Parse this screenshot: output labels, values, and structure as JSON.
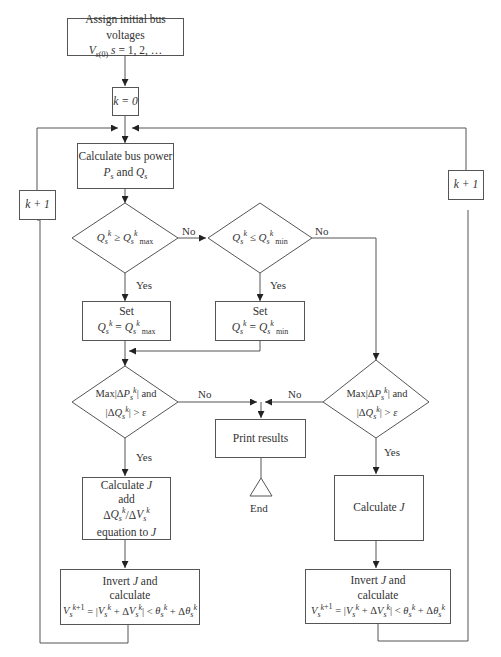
{
  "nodes": {
    "start": {
      "line1": "Assign initial bus voltages",
      "line2": "V s(0) s = 1, 2, …"
    },
    "k0": {
      "label": "k = 0"
    },
    "calc_power": {
      "line1": "Calculate bus power",
      "line2": "Ps and Qs"
    },
    "dec_qmax": {
      "label": "Qsk ≥ Qsk max"
    },
    "dec_qmin": {
      "label": "Qsk ≤ Qsk min"
    },
    "set_qmax": {
      "line1": "Set",
      "line2": "Qsk = Qsk max"
    },
    "set_qmin": {
      "line1": "Set",
      "line2": "Qsk = Qsk min"
    },
    "dec_conv_left": {
      "line1": "Max|ΔPsk| and",
      "line2": "|ΔQsk| > ε"
    },
    "dec_conv_right": {
      "line1": "Max|ΔPsk| and",
      "line2": "|ΔQsk| > ε"
    },
    "print": {
      "label": "Print results"
    },
    "end": {
      "label": "End"
    },
    "calc_j_left": {
      "line1": "Calculate J",
      "line2": "add",
      "line3": "ΔQsk/ΔVsk",
      "line4": "equation to J"
    },
    "calc_j_right": {
      "label": "Calculate J"
    },
    "invert_left": {
      "line1": "Invert J and",
      "line2": "calculate",
      "line3": "Vsk+1 = |Vsk + ΔVsk| < θsk + Δθsk"
    },
    "invert_right": {
      "line1": "Invert J and",
      "line2": "calculate",
      "line3": "Vsk+1 = |Vsk + ΔVsk| < θsk + Δθsk"
    },
    "loop_left": {
      "label": "k + 1"
    },
    "loop_right": {
      "label": "k + 1"
    }
  },
  "edge_labels": {
    "no1": "No",
    "no2": "No",
    "yes1": "Yes",
    "yes2": "Yes",
    "no3": "No",
    "no4": "No",
    "yes3": "Yes",
    "yes4": "Yes"
  }
}
